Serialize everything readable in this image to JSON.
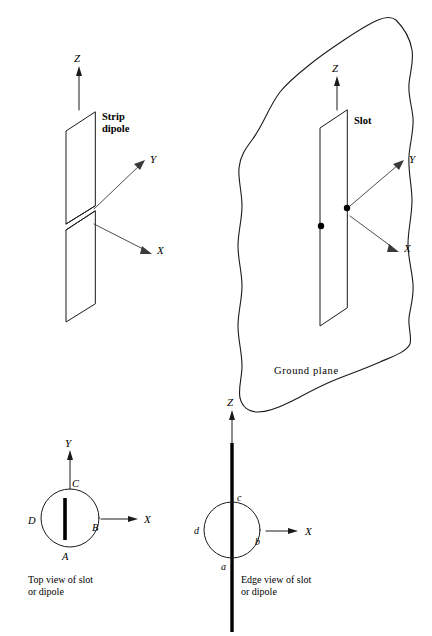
{
  "figure": {
    "panels": [
      {
        "id": "strip-dipole",
        "title": "Strip dipole",
        "title_line1": "Strip",
        "title_line2": "dipole",
        "axes": [
          {
            "name": "z-axis",
            "label": "Z"
          },
          {
            "name": "y-axis",
            "label": "Y"
          },
          {
            "name": "x-axis",
            "label": "X"
          }
        ]
      },
      {
        "id": "slot-ground-plane",
        "title": "Slot",
        "ground_label": "Ground plane",
        "axes": [
          {
            "name": "z-axis",
            "label": "Z"
          },
          {
            "name": "y-axis",
            "label": "Y"
          },
          {
            "name": "x-axis",
            "label": "X"
          }
        ]
      },
      {
        "id": "top-view",
        "caption_line1": "Top view of slot",
        "caption_line2": "or dipole",
        "axes": [
          {
            "name": "y-axis",
            "label": "Y"
          },
          {
            "name": "x-axis",
            "label": "X"
          }
        ],
        "points": [
          {
            "name": "point-a",
            "label": "A",
            "position": "bottom"
          },
          {
            "name": "point-b",
            "label": "B",
            "position": "right"
          },
          {
            "name": "point-c",
            "label": "C",
            "position": "top"
          },
          {
            "name": "point-d",
            "label": "D",
            "position": "left"
          }
        ]
      },
      {
        "id": "edge-view",
        "caption_line1": "Edge view of slot",
        "caption_line2": "or dipole",
        "axes": [
          {
            "name": "z-axis",
            "label": "Z"
          },
          {
            "name": "x-axis",
            "label": "X"
          }
        ],
        "points": [
          {
            "name": "point-a",
            "label": "a",
            "position": "bottom"
          },
          {
            "name": "point-b",
            "label": "b",
            "position": "right"
          },
          {
            "name": "point-c",
            "label": "c",
            "position": "top"
          },
          {
            "name": "point-d",
            "label": "d",
            "position": "left"
          }
        ]
      }
    ],
    "colors": {
      "ink": "#1a1a1a",
      "leader": "#3a3a3a",
      "background": "#ffffff"
    }
  }
}
